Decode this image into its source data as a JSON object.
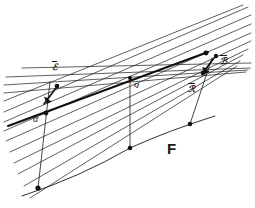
{
  "figure": {
    "title_label": "F",
    "background_color": "#ffffff",
    "ink_color": "#1a1a1a",
    "labels": {
      "vector_p": "ℰ",
      "vector_b": "ℬ",
      "vector_r": "ℛ",
      "angle_alpha": "α",
      "point_q": "Q",
      "surface_f": "F"
    },
    "geometry": {
      "convergence_point": {
        "x": 130,
        "y": 78
      },
      "fan_line_count": 14,
      "curve_points": [
        {
          "x": 38,
          "y": 188
        },
        {
          "x": 130,
          "y": 148
        },
        {
          "x": 190,
          "y": 124
        }
      ],
      "marker_points": [
        {
          "name": "left-base-point",
          "x": 38,
          "y": 188
        },
        {
          "name": "left-upper-point",
          "x": 46,
          "y": 113
        },
        {
          "name": "left-arrow-tip",
          "x": 56,
          "y": 88
        },
        {
          "name": "center-curve-point",
          "x": 130,
          "y": 148
        },
        {
          "name": "center-apex-point",
          "x": 130,
          "y": 78
        },
        {
          "name": "right-curve-point",
          "x": 190,
          "y": 124
        },
        {
          "name": "right-upper-point",
          "x": 205,
          "y": 72
        },
        {
          "name": "right-arrow-tip",
          "x": 215,
          "y": 58
        },
        {
          "name": "bold-line-point",
          "x": 205,
          "y": 53
        }
      ]
    },
    "label_positions": {
      "vector_p": {
        "x": 52,
        "y": 61
      },
      "vector_b": {
        "x": 218,
        "y": 56
      },
      "vector_r": {
        "x": 188,
        "y": 82
      },
      "angle_alpha": {
        "x": 34,
        "y": 116
      },
      "point_q": {
        "x": 134,
        "y": 82
      },
      "surface_f": {
        "x": 168,
        "y": 147
      }
    }
  }
}
